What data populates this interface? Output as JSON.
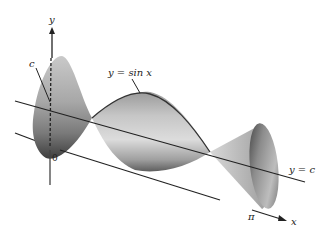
{
  "figure": {
    "labels": {
      "y_axis": "y",
      "x_axis": "x",
      "origin": "0",
      "pi": "π",
      "c": "c",
      "curve": "y = sin x",
      "axis_of_rotation": "y = c"
    },
    "colors": {
      "surface_light": "#d4d4d4",
      "surface_mid": "#a8a8a8",
      "surface_dark": "#5a5a5a",
      "line": "#222222"
    }
  }
}
